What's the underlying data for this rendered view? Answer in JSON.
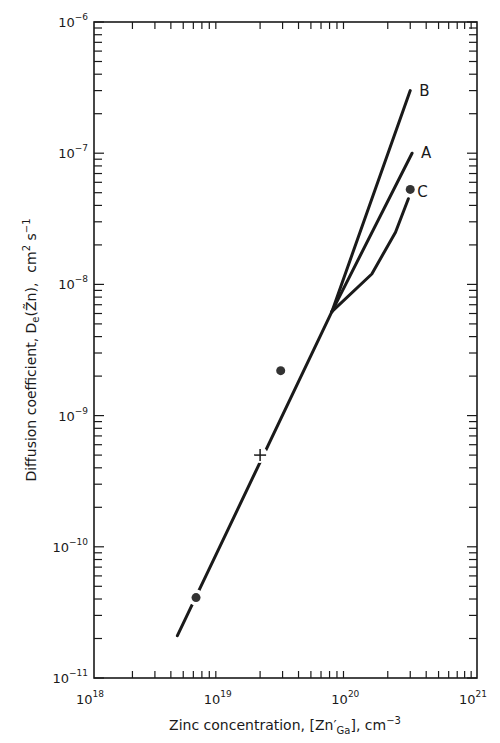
{
  "chart_data": {
    "type": "line",
    "title": "",
    "xlabel": "Zinc concentration, [Zn'_Ga], cm^-3",
    "xlabel_parts": {
      "main": "Zinc concentration, [Zn",
      "prime": "′",
      "sub": "Ga",
      "tail": "], cm",
      "exp": "−3"
    },
    "ylabel": "Diffusion coefficient, De(Z̃n), cm^2 s^-1",
    "ylabel_parts": {
      "main": "Diffusion coefficient, D",
      "sub": "e",
      "paren": "(Z̃n),",
      "unit": "cm",
      "exp1": "2",
      "s": " s",
      "exp2": "−1"
    },
    "xscale": "log",
    "yscale": "log",
    "xlim": [
      1e+18,
      1e+21
    ],
    "ylim": [
      1e-11,
      1e-06
    ],
    "grid": false,
    "legend": "none (curves labeled inline A, B, C)",
    "x_ticks": [
      {
        "base": "10",
        "exp": "18",
        "value": 1e+18
      },
      {
        "base": "10",
        "exp": "19",
        "value": 1e+19
      },
      {
        "base": "10",
        "exp": "20",
        "value": 1e+20
      },
      {
        "base": "10",
        "exp": "21",
        "value": 1e+21
      }
    ],
    "y_ticks": [
      {
        "base": "10",
        "exp": "−6",
        "value": 1e-06
      },
      {
        "base": "10",
        "exp": "−7",
        "value": 1e-07
      },
      {
        "base": "10",
        "exp": "−8",
        "value": 1e-08
      },
      {
        "base": "10",
        "exp": "−9",
        "value": 1e-09
      },
      {
        "base": "10",
        "exp": "−10",
        "value": 1e-10
      },
      {
        "base": "10",
        "exp": "−11",
        "value": 1e-11
      }
    ],
    "series": [
      {
        "name": "common",
        "label": "",
        "points": [
          [
            4.5e+18,
            2.1e-11
          ],
          [
            7.3e+19,
            6.2e-09
          ]
        ]
      },
      {
        "name": "B",
        "label": "B",
        "points": [
          [
            7.3e+19,
            6.2e-09
          ],
          [
            3e+20,
            3e-07
          ]
        ]
      },
      {
        "name": "A",
        "label": "A",
        "points": [
          [
            7.3e+19,
            6.2e-09
          ],
          [
            3.1e+20,
            1e-07
          ]
        ]
      },
      {
        "name": "C",
        "label": "C",
        "points": [
          [
            7.3e+19,
            6.2e-09
          ],
          [
            1.5e+20,
            1.2e-08
          ],
          [
            2.3e+20,
            2.5e-08
          ],
          [
            2.9e+20,
            4.5e-08
          ]
        ]
      }
    ],
    "markers": [
      {
        "type": "dot",
        "x": 6.3e+18,
        "y": 4.1e-11
      },
      {
        "type": "cross",
        "x": 2e+19,
        "y": 5e-10
      },
      {
        "type": "dot",
        "x": 2.9e+19,
        "y": 2.2e-09
      },
      {
        "type": "dot",
        "x": 3e+20,
        "y": 5.3e-08
      }
    ]
  },
  "colors": {
    "ink": "#1a1a1a",
    "background": "#ffffff"
  }
}
